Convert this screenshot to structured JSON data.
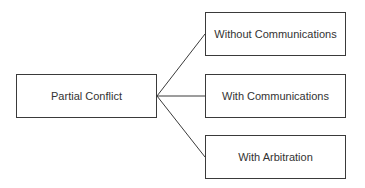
{
  "diagram": {
    "root": {
      "label": "Partial Conflict"
    },
    "children": [
      {
        "label": "Without Communications"
      },
      {
        "label": "With Communications"
      },
      {
        "label": "With Arbitration"
      }
    ]
  },
  "colors": {
    "line": "#3a3a3a",
    "text": "#333333",
    "background": "#ffffff"
  }
}
